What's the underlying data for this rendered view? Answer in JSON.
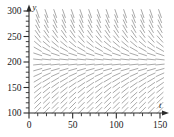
{
  "chart_data": {
    "type": "scatter",
    "plot_kind": "slope-field",
    "title": "",
    "xlabel": "t",
    "ylabel": "y",
    "xlim": [
      0,
      150
    ],
    "ylim": [
      100,
      300
    ],
    "grid": false,
    "legend": null,
    "x_ticks_major": [
      0,
      50,
      100,
      150
    ],
    "x_tick_labels": [
      "0",
      "50",
      "100",
      "150"
    ],
    "x_ticks_minor_step": 10,
    "y_ticks_major": [
      100,
      150,
      200,
      250,
      300
    ],
    "y_tick_labels": [
      "100",
      "150",
      "200",
      "250",
      "300"
    ],
    "y_ticks_minor_step": 10,
    "equilibrium_y": 200,
    "field_grid": {
      "x_start": 10,
      "x_end": 150,
      "x_step": 10,
      "y_start": 105,
      "y_end": 300,
      "y_step": 10
    },
    "slope_model": {
      "description": "dy/dt proportional to y*(1 - y/200); zero slope at y=200, positive below, negative above",
      "carrying_capacity": 200,
      "rate": 0.035
    },
    "axis_arrows": [
      "x-right",
      "y-up"
    ],
    "series": [
      {
        "name": "direction-field",
        "color": "#9a9a9a"
      }
    ]
  },
  "figure": {
    "x_axis_name": "t",
    "y_axis_name": "y"
  }
}
